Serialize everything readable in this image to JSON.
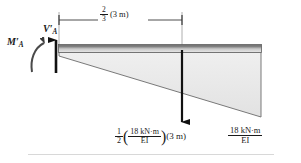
{
  "figure": {
    "dimension": {
      "name": "two-thirds-of-3m",
      "coefficient_numerator": "2",
      "coefficient_denominator": "3",
      "length_text": "(3 m)"
    },
    "reactions": {
      "shear": {
        "symbol": "V",
        "prime": "′",
        "subscript": "A"
      },
      "moment": {
        "symbol": "M",
        "prime": "′",
        "subscript": "A"
      }
    },
    "resultant_force": {
      "coefficient_numerator": "1",
      "coefficient_denominator": "2",
      "open_paren": "(",
      "close_paren": ")",
      "value_numerator": "18 kN·m",
      "value_denominator": "EI",
      "length_text": "(3 m)"
    },
    "end_ordinate": {
      "numerator": "18 kN·m",
      "denominator": "EI"
    }
  },
  "colors": {
    "beam_dark": "#6e6e6e",
    "beam_light": "#d9d9d9",
    "triangle_fill": "#ececec",
    "outline": "#555555",
    "arrow": "#111111",
    "rule": "#d8d8d8"
  }
}
